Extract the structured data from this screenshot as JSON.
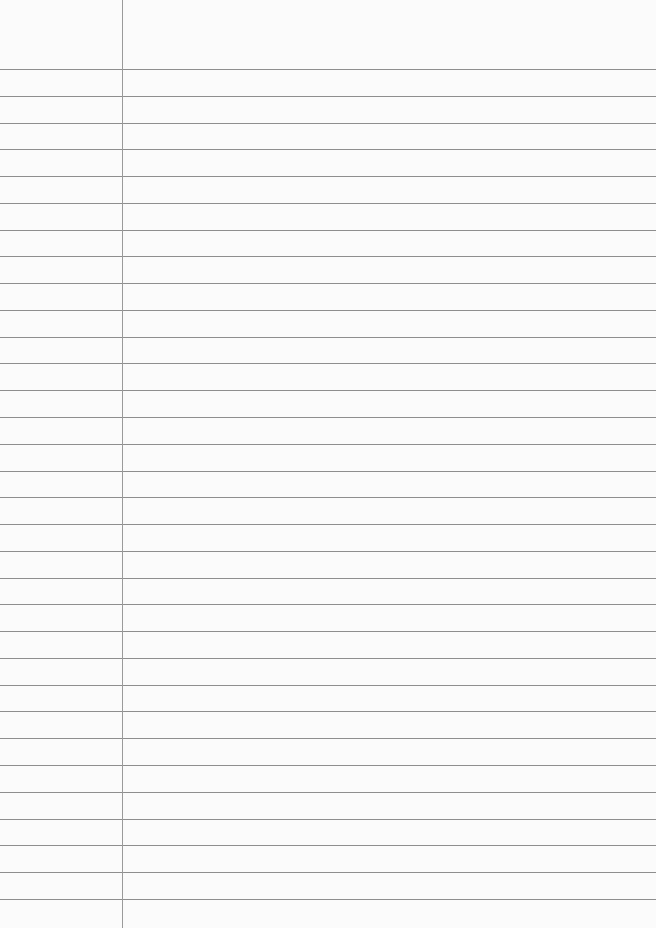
{
  "paper": {
    "type": "lined-notebook-page",
    "background_color": "#fbfbfb",
    "rule_color": "#8e8e8e",
    "margin_color": "#9a9a9a",
    "margin_x": 122,
    "first_rule_y": 69,
    "rule_spacing": 26.77,
    "rule_count": 32
  }
}
